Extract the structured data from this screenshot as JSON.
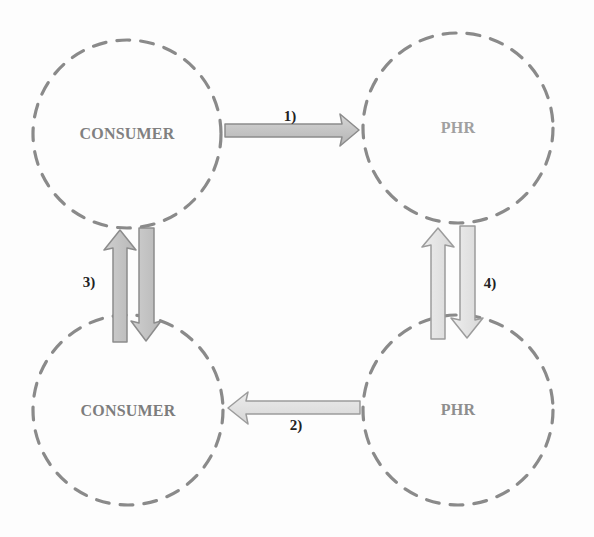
{
  "diagram": {
    "title": "",
    "nodes": [
      {
        "id": "consumer-top",
        "label": "CONSUMER",
        "cx": 127,
        "cy": 134,
        "r": 94,
        "text_color": "#808080"
      },
      {
        "id": "phr-top",
        "label": "PHR",
        "cx": 458,
        "cy": 128,
        "r": 95,
        "text_color": "#a0a0a0"
      },
      {
        "id": "consumer-bottom",
        "label": "CONSUMER",
        "cx": 128,
        "cy": 410,
        "r": 95,
        "text_color": "#7d7d7d"
      },
      {
        "id": "phr-bottom",
        "label": "PHR",
        "cx": 458,
        "cy": 410,
        "r": 95,
        "text_color": "#8e8e8e"
      }
    ],
    "edges": [
      {
        "id": "step-1",
        "label": "1)",
        "from": "consumer-top",
        "to": "phr-top",
        "direction": "right"
      },
      {
        "id": "step-2",
        "label": "2)",
        "from": "phr-bottom",
        "to": "consumer-bottom",
        "direction": "left"
      },
      {
        "id": "step-3",
        "label": "3)",
        "between": [
          "consumer-top",
          "consumer-bottom"
        ],
        "direction": "bidirectional"
      },
      {
        "id": "step-4",
        "label": "4)",
        "between": [
          "phr-top",
          "phr-bottom"
        ],
        "direction": "bidirectional"
      }
    ],
    "colors": {
      "circle_stroke": "#8a8a8a",
      "arrow_dark_fill": "#c4c4c4",
      "arrow_dark_stroke": "#8c8c8c",
      "arrow_light_fill": "#e2e2e2",
      "arrow_light_stroke": "#a0a0a0",
      "label_color": "#222222"
    }
  }
}
